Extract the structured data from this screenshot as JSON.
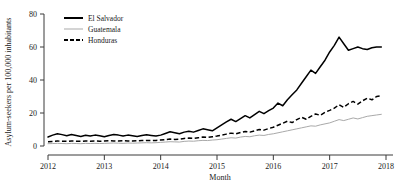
{
  "chart_data": {
    "type": "line",
    "title": "",
    "xlabel": "Month",
    "ylabel": "Asylum-seekers per 100,000 inhabitants",
    "xlim": [
      2012.0,
      2018.0
    ],
    "ylim": [
      0,
      80
    ],
    "yticks": [
      0,
      20,
      40,
      60,
      80
    ],
    "ytick_labels": [
      "0",
      "20",
      "40",
      "60",
      "80"
    ],
    "xticks": [
      2012,
      2013,
      2014,
      2015,
      2016,
      2017,
      2018
    ],
    "xtick_labels": [
      "2012",
      "2013",
      "2014",
      "2015",
      "2016",
      "2017",
      "2018"
    ],
    "grid": false,
    "legend_position": "top-left",
    "colors": {
      "el_salvador": "#000000",
      "guatemala": "#a9a9a9",
      "honduras": "#000000",
      "axis": "#3a3a3a",
      "background": "#ffffff"
    },
    "series": [
      {
        "name": "El Salvador",
        "style": "solid",
        "color": "#000000",
        "x": [
          2012.0,
          2012.083,
          2012.167,
          2012.25,
          2012.333,
          2012.417,
          2012.5,
          2012.583,
          2012.667,
          2012.75,
          2012.833,
          2012.917,
          2013.0,
          2013.083,
          2013.167,
          2013.25,
          2013.333,
          2013.417,
          2013.5,
          2013.583,
          2013.667,
          2013.75,
          2013.833,
          2013.917,
          2014.0,
          2014.083,
          2014.167,
          2014.25,
          2014.333,
          2014.417,
          2014.5,
          2014.583,
          2014.667,
          2014.75,
          2014.833,
          2014.917,
          2015.0,
          2015.083,
          2015.167,
          2015.25,
          2015.333,
          2015.417,
          2015.5,
          2015.583,
          2015.667,
          2015.75,
          2015.833,
          2015.917,
          2016.0,
          2016.083,
          2016.167,
          2016.25,
          2016.333,
          2016.417,
          2016.5,
          2016.583,
          2016.667,
          2016.75,
          2016.833,
          2016.917,
          2017.0,
          2017.083,
          2017.167,
          2017.25,
          2017.333,
          2017.417,
          2017.5,
          2017.583,
          2017.667,
          2017.75,
          2017.833,
          2017.917
        ],
        "values": [
          5.5,
          6.6,
          7.4,
          6.9,
          6.2,
          7.0,
          6.4,
          5.8,
          6.5,
          6.0,
          6.6,
          6.2,
          5.6,
          6.4,
          7.0,
          6.6,
          6.0,
          6.6,
          6.2,
          5.8,
          6.4,
          6.8,
          6.4,
          6.0,
          6.6,
          7.6,
          8.6,
          8.0,
          7.4,
          8.4,
          9.0,
          8.4,
          9.4,
          10.4,
          9.8,
          9.2,
          11.0,
          12.8,
          14.6,
          16.2,
          14.8,
          16.6,
          18.4,
          17.0,
          19.0,
          21.0,
          19.6,
          21.4,
          23.0,
          26.0,
          24.4,
          28.0,
          31.0,
          34.0,
          38.0,
          42.0,
          46.0,
          44.0,
          48.0,
          52.0,
          57.0,
          61.0,
          66.0,
          62.0,
          58.0,
          59.0,
          60.0,
          59.0,
          58.5,
          59.5,
          60.0,
          60.0
        ]
      },
      {
        "name": "Guatemala",
        "style": "solid-thin",
        "color": "#a9a9a9",
        "x": [
          2012.0,
          2012.083,
          2012.167,
          2012.25,
          2012.333,
          2012.417,
          2012.5,
          2012.583,
          2012.667,
          2012.75,
          2012.833,
          2012.917,
          2013.0,
          2013.083,
          2013.167,
          2013.25,
          2013.333,
          2013.417,
          2013.5,
          2013.583,
          2013.667,
          2013.75,
          2013.833,
          2013.917,
          2014.0,
          2014.083,
          2014.167,
          2014.25,
          2014.333,
          2014.417,
          2014.5,
          2014.583,
          2014.667,
          2014.75,
          2014.833,
          2014.917,
          2015.0,
          2015.083,
          2015.167,
          2015.25,
          2015.333,
          2015.417,
          2015.5,
          2015.583,
          2015.667,
          2015.75,
          2015.833,
          2015.917,
          2016.0,
          2016.083,
          2016.167,
          2016.25,
          2016.333,
          2016.417,
          2016.5,
          2016.583,
          2016.667,
          2016.75,
          2016.833,
          2016.917,
          2017.0,
          2017.083,
          2017.167,
          2017.25,
          2017.333,
          2017.417,
          2017.5,
          2017.583,
          2017.667,
          2017.75,
          2017.833,
          2017.917
        ],
        "values": [
          1.4,
          1.5,
          1.6,
          1.5,
          1.4,
          1.6,
          1.5,
          1.4,
          1.6,
          1.5,
          1.6,
          1.5,
          1.6,
          1.7,
          1.8,
          1.7,
          1.6,
          1.8,
          1.7,
          1.8,
          1.9,
          2.0,
          1.9,
          2.0,
          2.2,
          2.4,
          2.6,
          2.5,
          2.4,
          2.8,
          3.0,
          2.9,
          3.2,
          3.4,
          3.3,
          3.6,
          3.8,
          4.2,
          4.6,
          5.0,
          4.8,
          5.4,
          5.8,
          5.6,
          6.2,
          6.6,
          6.4,
          7.0,
          7.4,
          8.0,
          8.6,
          9.2,
          9.8,
          10.4,
          11.0,
          11.6,
          12.2,
          12.0,
          12.8,
          13.4,
          14.0,
          15.0,
          16.0,
          15.4,
          16.2,
          17.0,
          16.4,
          17.2,
          18.0,
          18.4,
          18.8,
          19.2
        ]
      },
      {
        "name": "Honduras",
        "style": "dashed",
        "color": "#000000",
        "x": [
          2012.0,
          2012.083,
          2012.167,
          2012.25,
          2012.333,
          2012.417,
          2012.5,
          2012.583,
          2012.667,
          2012.75,
          2012.833,
          2012.917,
          2013.0,
          2013.083,
          2013.167,
          2013.25,
          2013.333,
          2013.417,
          2013.5,
          2013.583,
          2013.667,
          2013.75,
          2013.833,
          2013.917,
          2014.0,
          2014.083,
          2014.167,
          2014.25,
          2014.333,
          2014.417,
          2014.5,
          2014.583,
          2014.667,
          2014.75,
          2014.833,
          2014.917,
          2015.0,
          2015.083,
          2015.167,
          2015.25,
          2015.333,
          2015.417,
          2015.5,
          2015.583,
          2015.667,
          2015.75,
          2015.833,
          2015.917,
          2016.0,
          2016.083,
          2016.167,
          2016.25,
          2016.333,
          2016.417,
          2016.5,
          2016.583,
          2016.667,
          2016.75,
          2016.833,
          2016.917,
          2017.0,
          2017.083,
          2017.167,
          2017.25,
          2017.333,
          2017.417,
          2017.5,
          2017.583,
          2017.667,
          2017.75,
          2017.833,
          2017.917
        ],
        "values": [
          2.6,
          2.8,
          3.0,
          2.9,
          2.8,
          3.0,
          2.9,
          2.8,
          3.0,
          2.9,
          3.0,
          2.9,
          3.0,
          3.2,
          3.1,
          3.0,
          3.2,
          3.1,
          3.0,
          3.2,
          3.3,
          3.4,
          3.3,
          3.4,
          3.6,
          3.9,
          4.2,
          4.0,
          4.2,
          4.6,
          4.8,
          4.6,
          5.0,
          5.4,
          5.2,
          5.6,
          6.0,
          6.6,
          7.2,
          7.8,
          7.4,
          8.2,
          8.8,
          8.4,
          9.2,
          10.0,
          9.6,
          10.6,
          11.4,
          12.6,
          13.8,
          15.0,
          14.2,
          16.0,
          17.4,
          16.2,
          18.0,
          19.4,
          18.6,
          20.4,
          21.6,
          23.0,
          25.0,
          23.4,
          25.6,
          27.0,
          25.4,
          27.4,
          29.0,
          28.0,
          30.0,
          30.4
        ]
      }
    ]
  },
  "legend": {
    "items": [
      {
        "label": "El Salvador",
        "key": "el_salvador"
      },
      {
        "label": "Guatemala",
        "key": "guatemala"
      },
      {
        "label": "Honduras",
        "key": "honduras"
      }
    ]
  }
}
